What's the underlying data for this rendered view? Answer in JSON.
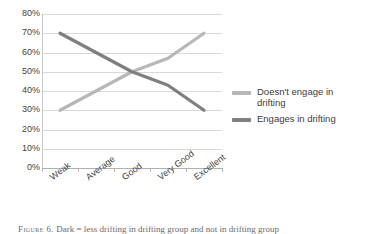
{
  "chart_data": {
    "type": "line",
    "title": "",
    "xlabel": "",
    "ylabel": "",
    "categories": [
      "Weak",
      "Average",
      "Good",
      "Very Good",
      "Excellent"
    ],
    "series": [
      {
        "name": "Doesn't engage in drifting",
        "color": "#b7b7b7",
        "values": [
          30,
          40,
          50,
          57,
          70
        ]
      },
      {
        "name": "Engages in drifting",
        "color": "#7f7f7f",
        "values": [
          70,
          60,
          50,
          43,
          30
        ]
      }
    ],
    "ylim": [
      0,
      80
    ],
    "y_ticks": [
      "0%",
      "10%",
      "20%",
      "30%",
      "40%",
      "50%",
      "60%",
      "70%",
      "80%"
    ],
    "y_tick_values": [
      0,
      10,
      20,
      30,
      40,
      50,
      60,
      70,
      80
    ],
    "grid": true,
    "legend_position": "right"
  },
  "legend": {
    "items": [
      {
        "label": "Doesn't engage in drifting",
        "color": "#b7b7b7"
      },
      {
        "label": "Engages in drifting",
        "color": "#7f7f7f"
      }
    ]
  },
  "caption": {
    "label": "Figure 6.",
    "text": "Dark = less drifting in drifting group and not in drifting group"
  },
  "colors": {
    "gridline": "#d9d9d9",
    "axis": "#b0b0b0",
    "text": "#3f3f3f"
  }
}
